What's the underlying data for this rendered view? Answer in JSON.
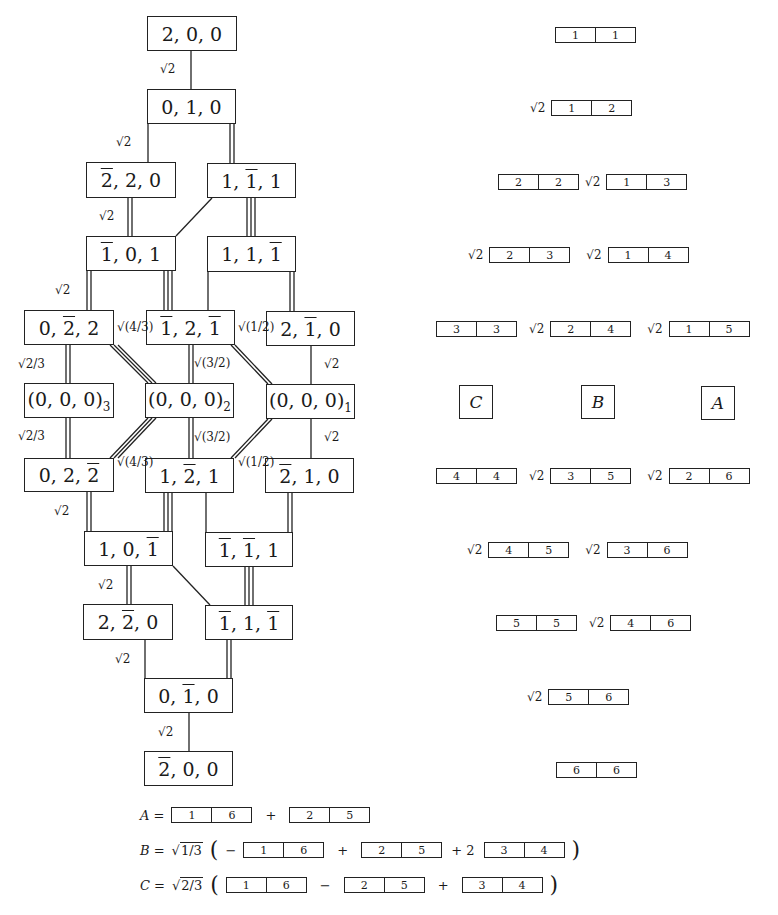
{
  "lattice": {
    "nodes": [
      {
        "id": "n200",
        "label": "2,0,0",
        "html": "2, 0, 0"
      },
      {
        "id": "n010",
        "label": "0,1,0"
      },
      {
        "id": "nm220",
        "label": "2̄,2,0"
      },
      {
        "id": "n1m11",
        "label": "1,1̄,1"
      },
      {
        "id": "nm101",
        "label": "1̄,0,1"
      },
      {
        "id": "n11m1",
        "label": "1,1,1̄"
      },
      {
        "id": "n0m22",
        "label": "0,2̄,2"
      },
      {
        "id": "nm12m1",
        "label": "1̄,2,1̄"
      },
      {
        "id": "n2m10",
        "label": "2,1̄,0"
      },
      {
        "id": "n000_3",
        "label": "(0,0,0)_3"
      },
      {
        "id": "n000_2",
        "label": "(0,0,0)_2"
      },
      {
        "id": "n000_1",
        "label": "(0,0,0)_1"
      },
      {
        "id": "n02m2",
        "label": "0,2,2̄"
      },
      {
        "id": "n1m21",
        "label": "1,2̄,1"
      },
      {
        "id": "nm210",
        "label": "2̄,1,0"
      },
      {
        "id": "n10m1",
        "label": "1,0,1̄"
      },
      {
        "id": "nm1m11",
        "label": "1̄,1̄,1"
      },
      {
        "id": "n2m20",
        "label": "2,2̄,0"
      },
      {
        "id": "nm11m1",
        "label": "1̄,1,1̄"
      },
      {
        "id": "n0m10",
        "label": "0,1̄,0"
      },
      {
        "id": "nm200",
        "label": "2̄,0,0"
      }
    ],
    "edge_labels": {
      "sqrt2": "√2",
      "sqrt_2_3": "√2/3",
      "sqrt_4_3": "√(4/3)",
      "sqrt_3_2": "√(3/2)",
      "sqrt_1_2": "√(1/2)"
    }
  },
  "tableaux_rows": [
    {
      "terms": [
        {
          "coef": "",
          "cells": [
            "1",
            "1"
          ]
        }
      ]
    },
    {
      "terms": [
        {
          "coef": "√2",
          "cells": [
            "1",
            "2"
          ]
        }
      ]
    },
    {
      "terms": [
        {
          "coef": "",
          "cells": [
            "2",
            "2"
          ]
        },
        {
          "coef": "√2",
          "cells": [
            "1",
            "3"
          ]
        }
      ]
    },
    {
      "terms": [
        {
          "coef": "√2",
          "cells": [
            "2",
            "3"
          ]
        },
        {
          "coef": "√2",
          "cells": [
            "1",
            "4"
          ]
        }
      ]
    },
    {
      "terms": [
        {
          "coef": "",
          "cells": [
            "3",
            "3"
          ]
        },
        {
          "coef": "√2",
          "cells": [
            "2",
            "4"
          ]
        },
        {
          "coef": "√2",
          "cells": [
            "1",
            "5"
          ]
        }
      ]
    },
    {
      "irreps": [
        "C",
        "B",
        "A"
      ]
    },
    {
      "terms": [
        {
          "coef": "",
          "cells": [
            "4",
            "4"
          ]
        },
        {
          "coef": "√2",
          "cells": [
            "3",
            "5"
          ]
        },
        {
          "coef": "√2",
          "cells": [
            "2",
            "6"
          ]
        }
      ]
    },
    {
      "terms": [
        {
          "coef": "√2",
          "cells": [
            "4",
            "5"
          ]
        },
        {
          "coef": "√2",
          "cells": [
            "3",
            "6"
          ]
        }
      ]
    },
    {
      "terms": [
        {
          "coef": "",
          "cells": [
            "5",
            "5"
          ]
        },
        {
          "coef": "√2",
          "cells": [
            "4",
            "6"
          ]
        }
      ]
    },
    {
      "terms": [
        {
          "coef": "√2",
          "cells": [
            "5",
            "6"
          ]
        }
      ]
    },
    {
      "terms": [
        {
          "coef": "",
          "cells": [
            "6",
            "6"
          ]
        }
      ]
    }
  ],
  "equations": {
    "A": {
      "lhs": "A =",
      "t1": [
        "1",
        "6"
      ],
      "op1": "+",
      "t2": [
        "2",
        "5"
      ]
    },
    "B": {
      "lhs": "B =",
      "prefactor": "1/3",
      "sign0": "−",
      "t1": [
        "1",
        "6"
      ],
      "op1": "+",
      "t2": [
        "2",
        "5"
      ],
      "op2": "+ 2",
      "t3": [
        "3",
        "4"
      ]
    },
    "C": {
      "lhs": "C =",
      "prefactor": "2/3",
      "t1": [
        "1",
        "6"
      ],
      "op1": "−",
      "t2": [
        "2",
        "5"
      ],
      "op2": "+",
      "t3": [
        "3",
        "4"
      ]
    }
  },
  "common": {
    "sqrt2": "2",
    "sqrt_sym": "√",
    "open_paren": "(",
    "close_paren": ")"
  }
}
